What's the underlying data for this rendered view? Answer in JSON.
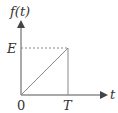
{
  "diagram": {
    "type": "ramp-function-plot",
    "y_axis_label": "f(t)",
    "x_axis_label": "t",
    "origin_label": "0",
    "y_level_label": "E",
    "x_end_label": "T",
    "colors": {
      "axis": "#555555",
      "ramp": "#888888",
      "dashed": "#888888",
      "text": "#333333"
    }
  }
}
